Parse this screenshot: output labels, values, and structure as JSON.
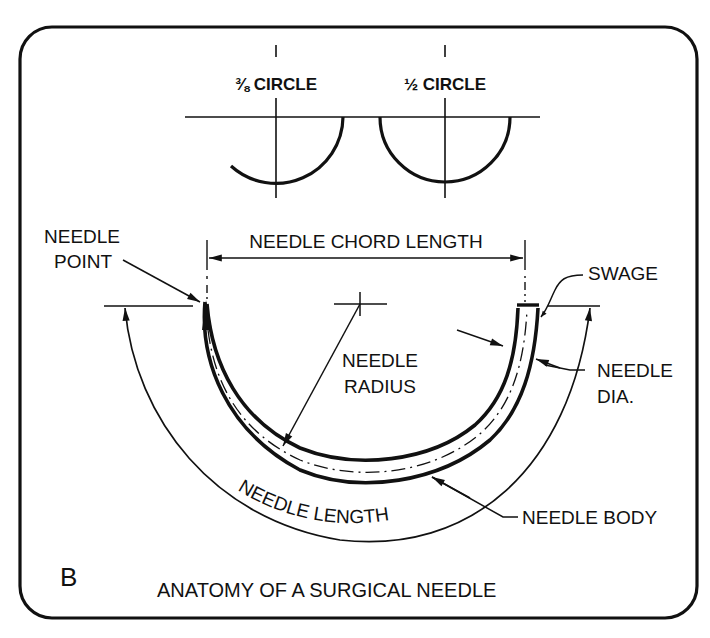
{
  "figure": {
    "panel_label": "B",
    "caption": "ANATOMY OF A SURGICAL NEEDLE",
    "ink_color": "#111111",
    "background_color": "#ffffff"
  },
  "curvature_examples": [
    {
      "label": "⅜ CIRCLE",
      "fraction": "3/8"
    },
    {
      "label": "½ CIRCLE",
      "fraction": "1/2"
    }
  ],
  "annotations": {
    "needle_point_line1": "NEEDLE",
    "needle_point_line2": "POINT",
    "chord_length": "NEEDLE CHORD LENGTH",
    "swage": "SWAGE",
    "radius_line1": "NEEDLE",
    "radius_line2": "RADIUS",
    "diameter_line1": "NEEDLE",
    "diameter_line2": "DIA.",
    "body": "NEEDLE BODY",
    "length_word1": "NEEDLE",
    "length_word2": "LENGTH"
  }
}
